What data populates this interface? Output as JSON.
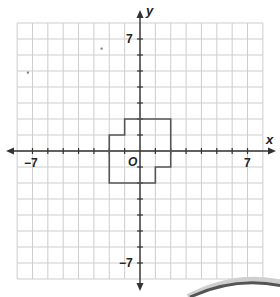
{
  "figure": {
    "grid": {
      "x_min": -8,
      "x_max": 8,
      "y_min": -8,
      "y_max": 8,
      "line_color": "#cdcdcd"
    },
    "axes": {
      "x_label": "x",
      "y_label": "y",
      "origin_label": "O",
      "tick_labels": {
        "x_neg": "−7",
        "x_pos": "7",
        "y_pos": "7",
        "y_neg": "−7"
      },
      "color": "#333333"
    },
    "shape": {
      "name": "polygon",
      "vertices": [
        [
          -1,
          2
        ],
        [
          2,
          2
        ],
        [
          2,
          -1
        ],
        [
          1,
          -1
        ],
        [
          1,
          -2
        ],
        [
          -2,
          -2
        ],
        [
          -2,
          1
        ],
        [
          -1,
          1
        ]
      ],
      "stroke": "#555555"
    },
    "stray_marks": [
      [
        -7.3,
        4.9
      ],
      [
        -2.5,
        6.4
      ]
    ]
  }
}
